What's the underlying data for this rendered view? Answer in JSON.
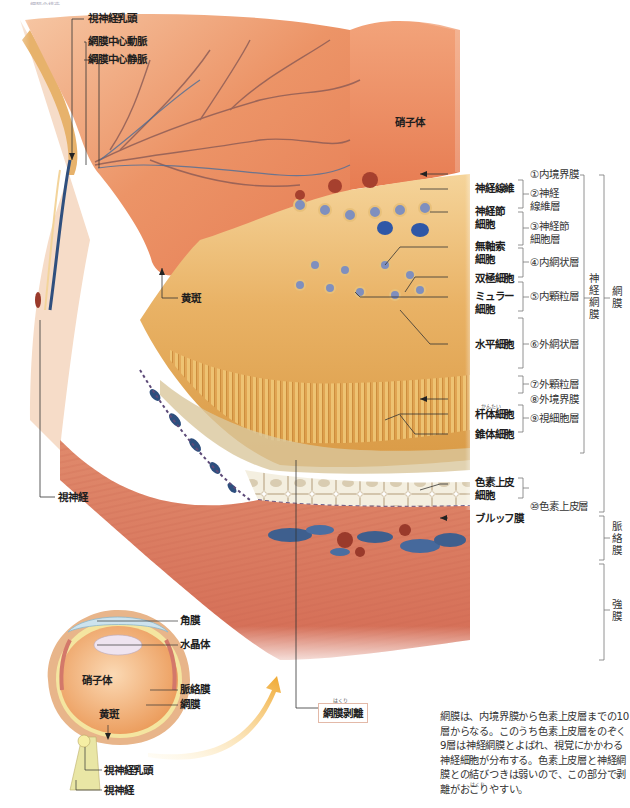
{
  "figure": {
    "title_main": "網膜の構造",
    "big_diagram": {
      "region_labels": {
        "vitreous": "硝子体",
        "macula": "黄斑",
        "optic_nerve": "視神経"
      },
      "top_callouts": [
        {
          "id": "optic_disc",
          "label": "視神経乳頭"
        },
        {
          "id": "central_artery",
          "label": "網膜中心動脈"
        },
        {
          "id": "central_vein",
          "label": "網膜中心静脈"
        }
      ],
      "cell_callouts": [
        {
          "id": "nerve_fiber",
          "label": "神経線維"
        },
        {
          "id": "ganglion_cell",
          "label": "神経節\n細胞"
        },
        {
          "id": "amacrine_cell",
          "label": "無軸索\n細胞"
        },
        {
          "id": "bipolar_cell",
          "label": "双極細胞"
        },
        {
          "id": "muller_cell",
          "label": "ミュラー\n細胞"
        },
        {
          "id": "horizontal_cell",
          "label": "水平細胞"
        },
        {
          "id": "rod_cell",
          "label": "杆体細胞",
          "ruby": "かんたい"
        },
        {
          "id": "cone_cell",
          "label": "錐体細胞"
        },
        {
          "id": "rpe_cell",
          "label": "色素上皮\n細胞"
        },
        {
          "id": "bruch_membrane",
          "label": "ブルッフ膜"
        }
      ],
      "layers": [
        {
          "num": "①",
          "label": "内境界膜"
        },
        {
          "num": "②",
          "label": "神経\n線維層"
        },
        {
          "num": "③",
          "label": "神経節\n細胞層"
        },
        {
          "num": "④",
          "label": "内網状層"
        },
        {
          "num": "⑤",
          "label": "内顆粒層"
        },
        {
          "num": "⑥",
          "label": "外網状層"
        },
        {
          "num": "⑦",
          "label": "外顆粒層"
        },
        {
          "num": "⑧",
          "label": "外境界膜"
        },
        {
          "num": "⑨",
          "label": "視細胞層"
        },
        {
          "num": "⑩",
          "label": "色素上皮層"
        }
      ],
      "brackets": {
        "neural_retina": "神経網膜",
        "retina": "網膜",
        "choroid": "脈絡膜",
        "sclera": "強膜"
      },
      "detachment_badge": {
        "label": "網膜剥離",
        "ruby": "はくり"
      }
    },
    "small_eye": {
      "labels": {
        "cornea": "角膜",
        "lens": "水晶体",
        "vitreous": "硝子体",
        "choroid": "脈絡膜",
        "retina": "網膜",
        "macula": "黄斑",
        "optic_disc": "視神経乳頭",
        "optic_nerve": "視神経"
      }
    },
    "caption": {
      "text": "網膜は、内境界膜から色素上皮層までの10層からなる。このうち色素上皮層をのぞく9層は神経網膜とよばれ、視覚にかかわる神経細胞が分布する。色素上皮層と神経網膜との結びつきは弱いので、この部分で剥離がおこりやすい。",
      "ruby_hakuri": "はくり"
    },
    "colors": {
      "vitreous": "#e98a60",
      "retina_bg": "#e8b56a",
      "sclera": "#d9705a",
      "vessel_blue": "#3e5f8e",
      "rpe": "#f1ead8",
      "arrow": "#f0a830"
    }
  }
}
